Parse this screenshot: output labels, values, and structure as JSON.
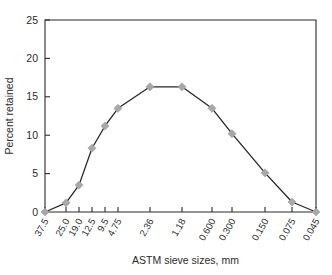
{
  "chart_data": {
    "type": "line",
    "title": "",
    "xlabel": "ASTM sieve sizes, mm",
    "ylabel": "Percent retained",
    "categories": [
      "37.5",
      "25.0",
      "19.0",
      "12.5",
      "9.5",
      "4.75",
      "2.36",
      "1.18",
      "0.600",
      "0.300",
      "0.150",
      "0.075",
      "0.045"
    ],
    "values": [
      0.0,
      1.2,
      3.5,
      8.3,
      11.2,
      13.5,
      16.3,
      16.3,
      13.5,
      10.2,
      5.1,
      1.3,
      0.0
    ],
    "series": [
      {
        "name": "Percent retained",
        "values": [
          0.0,
          1.2,
          3.5,
          8.3,
          11.2,
          13.5,
          16.3,
          16.3,
          13.5,
          10.2,
          5.1,
          1.3,
          0.0
        ]
      }
    ],
    "ylim": [
      0,
      25
    ],
    "yticks": [
      0,
      5,
      10,
      15,
      20,
      25
    ],
    "ytick_labels": [
      "0",
      "5",
      "10",
      "15",
      "20",
      "25"
    ],
    "grid": false,
    "legend": "none",
    "marker": "diamond",
    "marker_color": "#a8a8a8",
    "line_color": "#262626",
    "axis_color": "#2b2b2b",
    "x_positions": [
      45,
      66,
      79,
      92,
      105,
      118,
      150,
      182,
      212,
      232,
      265,
      292,
      316
    ],
    "xtick_label_rotation": -60
  }
}
